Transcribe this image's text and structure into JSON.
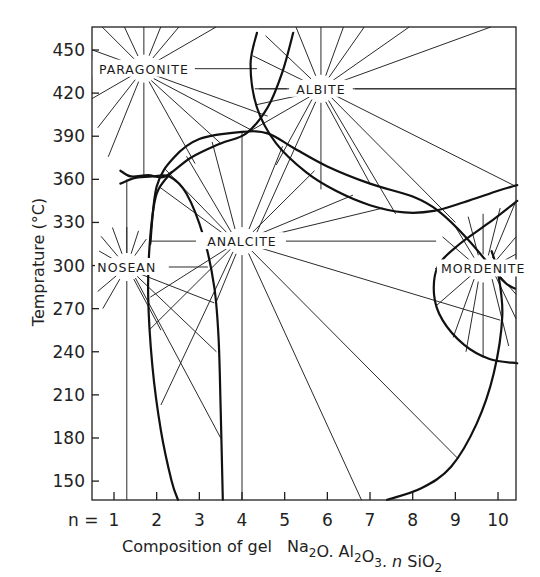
{
  "chart_data": {
    "type": "line",
    "subtype": "phase-diagram",
    "title": "",
    "xlabel": "Composition of gel Na2O.Al2O3.nSiO2",
    "xlabel_parts": {
      "prefix": "Composition of gel",
      "formula": [
        {
          "t": "Na",
          "sub": false
        },
        {
          "t": "2",
          "sub": true
        },
        {
          "t": "O. Al",
          "sub": false
        },
        {
          "t": "2",
          "sub": true
        },
        {
          "t": "O",
          "sub": false
        },
        {
          "t": "3",
          "sub": true
        },
        {
          "t": ". ",
          "sub": false
        },
        {
          "t": "n",
          "sub": false,
          "italic": true
        },
        {
          "t": " SiO",
          "sub": false
        },
        {
          "t": "2",
          "sub": true
        }
      ]
    },
    "ylabel": "Temprature (°C)",
    "x_tick_prefix": "n =",
    "x_ticks": [
      1,
      2,
      3,
      4,
      5,
      6,
      7,
      8,
      9,
      10
    ],
    "y_ticks": [
      150,
      180,
      210,
      240,
      270,
      300,
      330,
      360,
      390,
      420,
      450
    ],
    "xlim": [
      0.55,
      10.45
    ],
    "ylim": [
      137,
      462
    ],
    "grid": false,
    "legend": null,
    "phases": [
      {
        "name": "PARAGONITE",
        "center": {
          "n": 1.7,
          "T": 437
        }
      },
      {
        "name": "ALBITE",
        "center": {
          "n": 5.85,
          "T": 423
        }
      },
      {
        "name": "ANALCITE",
        "center": {
          "n": 4.0,
          "T": 317
        }
      },
      {
        "name": "NOSEAN",
        "center": {
          "n": 1.3,
          "T": 299
        }
      },
      {
        "name": "MORDENITE",
        "center": {
          "n": 9.65,
          "T": 298
        }
      }
    ],
    "boundaries": [
      {
        "name": "analcite-field-upper",
        "points": [
          [
            1.85,
            315
          ],
          [
            2.0,
            355
          ],
          [
            2.4,
            375
          ],
          [
            3.0,
            388
          ],
          [
            4.0,
            393
          ],
          [
            4.6,
            392
          ],
          [
            5.2,
            382
          ],
          [
            6.0,
            369
          ],
          [
            7.0,
            357
          ],
          [
            8.0,
            348
          ],
          [
            8.6,
            338
          ],
          [
            9.3,
            318
          ],
          [
            10.1,
            290
          ],
          [
            10.4,
            284
          ]
        ]
      },
      {
        "name": "albite-field-lower",
        "points": [
          [
            4.35,
            462
          ],
          [
            4.2,
            440
          ],
          [
            4.35,
            410
          ],
          [
            4.8,
            385
          ],
          [
            5.5,
            365
          ],
          [
            6.2,
            352
          ],
          [
            7.0,
            342
          ],
          [
            7.8,
            337
          ],
          [
            8.5,
            338
          ],
          [
            9.2,
            344
          ],
          [
            10.0,
            352
          ],
          [
            10.45,
            356
          ]
        ]
      },
      {
        "name": "albite-paragonite-boundary",
        "points": [
          [
            5.2,
            462
          ],
          [
            4.95,
            435
          ],
          [
            4.6,
            410
          ],
          [
            4.1,
            392
          ],
          [
            3.5,
            385
          ],
          [
            2.8,
            375
          ],
          [
            2.2,
            362
          ],
          [
            1.8,
            363
          ],
          [
            1.4,
            362
          ],
          [
            1.15,
            366
          ]
        ]
      },
      {
        "name": "nosean-paragonite-lens",
        "points": [
          [
            1.15,
            357
          ],
          [
            1.5,
            361
          ],
          [
            1.9,
            362
          ],
          [
            2.3,
            362
          ],
          [
            2.7,
            350
          ],
          [
            3.1,
            320
          ],
          [
            3.35,
            285
          ],
          [
            3.45,
            250
          ],
          [
            3.5,
            200
          ],
          [
            3.55,
            137
          ]
        ]
      },
      {
        "name": "analcite-left-boundary",
        "points": [
          [
            2.35,
            365
          ],
          [
            2.0,
            350
          ],
          [
            1.85,
            320
          ],
          [
            1.8,
            280
          ],
          [
            1.9,
            230
          ],
          [
            2.1,
            185
          ],
          [
            2.35,
            150
          ],
          [
            2.5,
            137
          ]
        ]
      },
      {
        "name": "mordenite-field",
        "points": [
          [
            10.45,
            345
          ],
          [
            9.8,
            330
          ],
          [
            9.1,
            315
          ],
          [
            8.6,
            300
          ],
          [
            8.5,
            280
          ],
          [
            8.7,
            262
          ],
          [
            9.2,
            245
          ],
          [
            9.8,
            235
          ],
          [
            10.45,
            232
          ]
        ]
      },
      {
        "name": "analcite-mordenite-lower",
        "points": [
          [
            7.4,
            137
          ],
          [
            8.2,
            145
          ],
          [
            8.9,
            160
          ],
          [
            9.5,
            190
          ],
          [
            9.9,
            225
          ],
          [
            10.1,
            265
          ],
          [
            10.0,
            295
          ],
          [
            9.85,
            310
          ]
        ]
      }
    ]
  }
}
